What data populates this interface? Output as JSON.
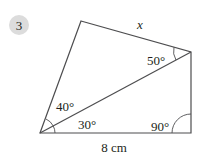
{
  "question": {
    "number": "3",
    "badge_color": "#dcdcdc"
  },
  "figure": {
    "type": "quadrilateral split into two triangles by a diagonal",
    "line_color": "#4d4d4f",
    "vertices": {
      "top": [
        81,
        21
      ],
      "right": [
        191,
        52
      ],
      "bottom_right": [
        191,
        133
      ],
      "bottom_left": [
        40,
        133
      ]
    },
    "labels": {
      "side_top": "x",
      "angle_right_upper": "50°",
      "angle_left_upper": "40°",
      "angle_left_lower": "30°",
      "angle_bottom_right": "90°",
      "side_bottom": "8 cm"
    }
  }
}
